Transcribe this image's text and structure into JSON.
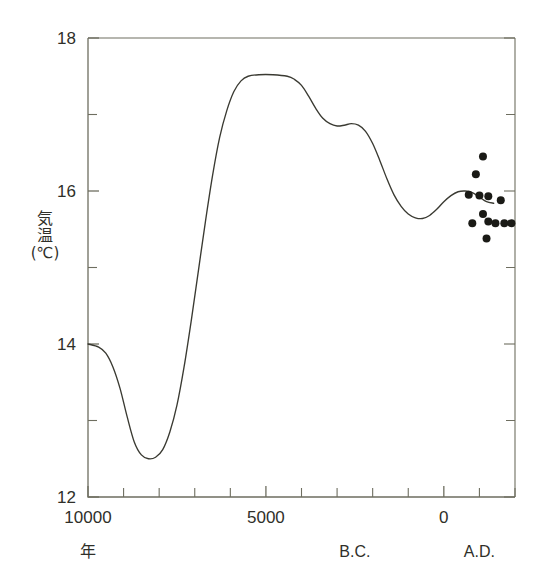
{
  "chart_data": {
    "type": "line",
    "title": "",
    "subtitle": "",
    "xlabel": "年",
    "ylabel": "気温(℃)",
    "ylabel_chars": [
      "気",
      "温",
      "(℃)"
    ],
    "x_axis": {
      "orientation": "reversed",
      "tick_labels": [
        "10000",
        "5000",
        "0"
      ],
      "tick_values": [
        10000,
        5000,
        0
      ],
      "minor_tick_step": 1000,
      "range": [
        10000,
        -2000
      ],
      "era_labels": [
        "年",
        "B.C.",
        "A.D."
      ],
      "era_label_x": [
        10000,
        2500,
        -1000
      ]
    },
    "y_axis": {
      "tick_labels": [
        "18",
        "16",
        "14",
        "12"
      ],
      "tick_values": [
        18,
        16,
        14,
        12
      ],
      "minor_tick_values": [
        17,
        15,
        13
      ],
      "range": [
        12,
        18
      ],
      "unit": "℃"
    },
    "grid": false,
    "legend": false,
    "series": [
      {
        "name": "気温曲線",
        "type": "line",
        "color": "#3a3a32",
        "points": [
          [
            10000,
            14.0
          ],
          [
            9700,
            13.96
          ],
          [
            9500,
            13.88
          ],
          [
            9300,
            13.7
          ],
          [
            9100,
            13.42
          ],
          [
            8900,
            13.05
          ],
          [
            8700,
            12.72
          ],
          [
            8500,
            12.55
          ],
          [
            8300,
            12.5
          ],
          [
            8100,
            12.52
          ],
          [
            7900,
            12.62
          ],
          [
            7700,
            12.85
          ],
          [
            7500,
            13.2
          ],
          [
            7300,
            13.7
          ],
          [
            7100,
            14.3
          ],
          [
            6900,
            14.95
          ],
          [
            6700,
            15.6
          ],
          [
            6500,
            16.2
          ],
          [
            6300,
            16.7
          ],
          [
            6100,
            17.05
          ],
          [
            5900,
            17.3
          ],
          [
            5700,
            17.44
          ],
          [
            5500,
            17.5
          ],
          [
            5200,
            17.52
          ],
          [
            4800,
            17.52
          ],
          [
            4400,
            17.5
          ],
          [
            4200,
            17.46
          ],
          [
            4000,
            17.38
          ],
          [
            3800,
            17.24
          ],
          [
            3600,
            17.08
          ],
          [
            3400,
            16.95
          ],
          [
            3200,
            16.88
          ],
          [
            3000,
            16.85
          ],
          [
            2800,
            16.86
          ],
          [
            2600,
            16.88
          ],
          [
            2400,
            16.86
          ],
          [
            2200,
            16.78
          ],
          [
            2000,
            16.62
          ],
          [
            1800,
            16.4
          ],
          [
            1600,
            16.16
          ],
          [
            1400,
            15.95
          ],
          [
            1200,
            15.8
          ],
          [
            1000,
            15.7
          ],
          [
            800,
            15.65
          ],
          [
            600,
            15.64
          ],
          [
            400,
            15.68
          ],
          [
            200,
            15.76
          ],
          [
            0,
            15.86
          ],
          [
            -200,
            15.94
          ],
          [
            -400,
            15.99
          ],
          [
            -600,
            16.0
          ],
          [
            -800,
            15.98
          ],
          [
            -1000,
            15.92
          ],
          [
            -1200,
            15.86
          ],
          [
            -1400,
            15.84
          ]
        ]
      },
      {
        "name": "観測点",
        "type": "scatter",
        "color": "#1a1a16",
        "marker": "filled-circle",
        "marker_size_px": 8,
        "points": [
          [
            -1100,
            16.45
          ],
          [
            -900,
            16.22
          ],
          [
            -700,
            15.95
          ],
          [
            -1000,
            15.94
          ],
          [
            -1250,
            15.93
          ],
          [
            -1600,
            15.88
          ],
          [
            -1100,
            15.7
          ],
          [
            -1250,
            15.6
          ],
          [
            -800,
            15.58
          ],
          [
            -1450,
            15.58
          ],
          [
            -1700,
            15.58
          ],
          [
            -1900,
            15.58
          ],
          [
            -1200,
            15.38
          ]
        ]
      }
    ],
    "axis_color": "#6e6e60",
    "line_color": "#3a3a32",
    "dot_color": "#1a1a16",
    "background": "#ffffff"
  },
  "geometry": {
    "plot_left": 88,
    "plot_right": 515,
    "plot_top": 38,
    "plot_bottom": 497
  }
}
